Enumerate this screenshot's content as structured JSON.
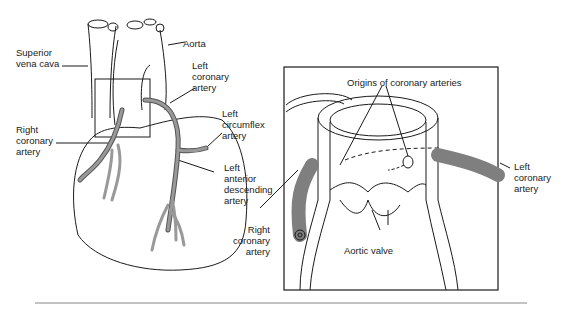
{
  "figure": {
    "left_panel": {
      "labels": {
        "svc": "Superior\nvena cava",
        "aorta": "Aorta",
        "lca": "Left\ncoronary\nartery",
        "rca": "Right\ncoronary\nartery",
        "lcx": "Left\ncircumflex\nartery",
        "lad": "Left\nanterior\ndescending\nartery"
      }
    },
    "right_panel": {
      "labels": {
        "origins": "Origins of coronary arteries",
        "lca": "Left\ncoronary\nartery",
        "rca": "Right\ncoronary\nartery",
        "valve": "Aortic valve"
      }
    },
    "colors": {
      "line": "#1a1a1a",
      "artery_fill": "#8c8c8c",
      "rule": "#888888"
    }
  }
}
